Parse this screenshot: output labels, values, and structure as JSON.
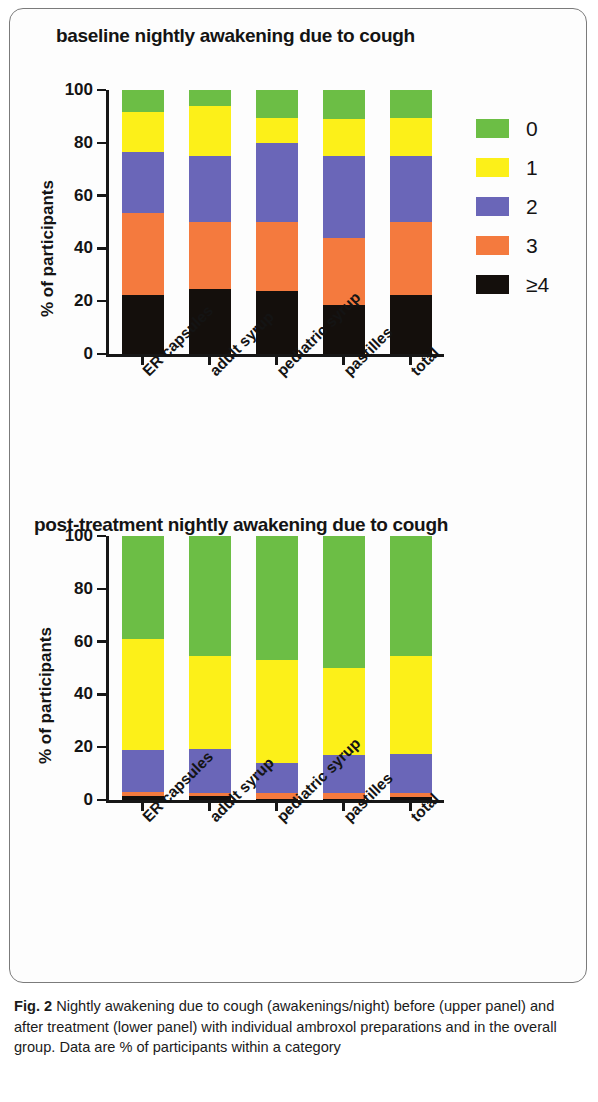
{
  "figure": {
    "caption_label": "Fig. 2",
    "caption_text": " Nightly awakening due to cough (awakenings/night) before (upper panel) and after treatment (lower panel) with individual ambroxol preparations and in the overall group. Data are % of participants within a category"
  },
  "colors": {
    "cat0": "#6cbe45",
    "cat1": "#fcf019",
    "cat2": "#6a66b8",
    "cat3": "#f47a3e",
    "cat4": "#140f0c",
    "axis": "#171717",
    "text": "#141414",
    "border": "#7b7b7b"
  },
  "legend": {
    "entries": [
      {
        "label": "0",
        "color": "#6cbe45"
      },
      {
        "label": "1",
        "color": "#fcf019"
      },
      {
        "label": "2",
        "color": "#6a66b8"
      },
      {
        "label": "3",
        "color": "#f47a3e"
      },
      {
        "label": "≥4",
        "color": "#140f0c"
      }
    ]
  },
  "chart_data": [
    {
      "type": "bar",
      "stacked": true,
      "panel": "upper",
      "title": "baseline nightly awakening due to cough",
      "xlabel": "",
      "ylabel": "% of participants",
      "ylim": [
        0,
        100
      ],
      "yticks": [
        0,
        20,
        40,
        60,
        80,
        100
      ],
      "grid": false,
      "legend_position": "right",
      "categories": [
        "ER capsules",
        "adult syrup",
        "pediatric syrup",
        "pastilles",
        "total"
      ],
      "series": [
        {
          "name": "≥4",
          "color": "#140f0c",
          "values": [
            22.5,
            24.5,
            24.0,
            18.5,
            22.5
          ]
        },
        {
          "name": "3",
          "color": "#f47a3e",
          "values": [
            31.0,
            25.5,
            26.0,
            25.5,
            27.5
          ]
        },
        {
          "name": "2",
          "color": "#6a66b8",
          "values": [
            23.0,
            25.0,
            30.0,
            31.0,
            25.0
          ]
        },
        {
          "name": "1",
          "color": "#fcf019",
          "values": [
            15.0,
            19.0,
            9.5,
            14.0,
            14.5
          ]
        },
        {
          "name": "0",
          "color": "#6cbe45",
          "values": [
            8.5,
            6.0,
            10.5,
            11.0,
            10.5
          ]
        }
      ]
    },
    {
      "type": "bar",
      "stacked": true,
      "panel": "lower",
      "title": "post-treatment nightly awakening due to cough",
      "xlabel": "",
      "ylabel": "% of participants",
      "ylim": [
        0,
        100
      ],
      "yticks": [
        0,
        20,
        40,
        60,
        80,
        100
      ],
      "grid": false,
      "legend_position": "right",
      "categories": [
        "ER capsules",
        "adult syrup",
        "pediatric syrup",
        "pastilles",
        "total"
      ],
      "series": [
        {
          "name": "≥4",
          "color": "#140f0c",
          "values": [
            1.5,
            1.5,
            0.5,
            0.5,
            1.0
          ]
        },
        {
          "name": "3",
          "color": "#f47a3e",
          "values": [
            1.5,
            1.0,
            2.0,
            2.0,
            1.5
          ]
        },
        {
          "name": "2",
          "color": "#6a66b8",
          "values": [
            16.0,
            17.0,
            11.5,
            14.5,
            15.0
          ]
        },
        {
          "name": "1",
          "color": "#fcf019",
          "values": [
            42.0,
            35.0,
            39.0,
            33.0,
            37.0
          ]
        },
        {
          "name": "0",
          "color": "#6cbe45",
          "values": [
            39.0,
            45.5,
            47.0,
            50.0,
            45.5
          ]
        }
      ]
    }
  ]
}
